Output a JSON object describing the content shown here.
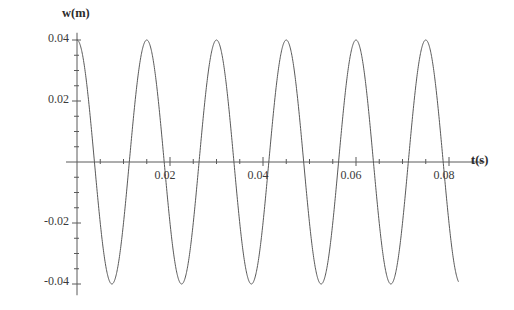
{
  "chart_data": {
    "type": "line",
    "title": "",
    "subtitle": "",
    "xlabel": "t(s)",
    "ylabel": "w(m)",
    "xlim": [
      0,
      0.0855
    ],
    "ylim": [
      -0.045,
      0.045
    ],
    "grid": false,
    "legend": null,
    "x_ticks": [
      {
        "value": 0.02,
        "label": "0.02"
      },
      {
        "value": 0.04,
        "label": "0.04"
      },
      {
        "value": 0.06,
        "label": "0.06"
      },
      {
        "value": 0.08,
        "label": "0.08"
      }
    ],
    "x_minor_tick_step": 0.005,
    "y_ticks": [
      {
        "value": 0.04,
        "label": "0.04"
      },
      {
        "value": 0.02,
        "label": "0.02"
      },
      {
        "value": -0.02,
        "label": "-0.02"
      },
      {
        "value": -0.04,
        "label": "-0.04"
      }
    ],
    "y_minor_tick_step": 0.005,
    "series": [
      {
        "name": "w(t)",
        "color": "#595959",
        "amplitude": 0.04,
        "period": 0.015,
        "phase": "cosine",
        "t_start": 0.0,
        "t_end": 0.082,
        "description": "w(t) = 0.04 cos(2 pi t / 0.015)",
        "peaks_t": [
          0.0,
          0.015,
          0.03,
          0.045,
          0.06,
          0.075
        ],
        "troughs_t": [
          0.0075,
          0.0225,
          0.0375,
          0.0525,
          0.0675
        ],
        "peak_value": 0.04,
        "trough_value": -0.04
      }
    ]
  },
  "axis": {
    "y_label": "w(m)",
    "x_label": "t(s)"
  }
}
